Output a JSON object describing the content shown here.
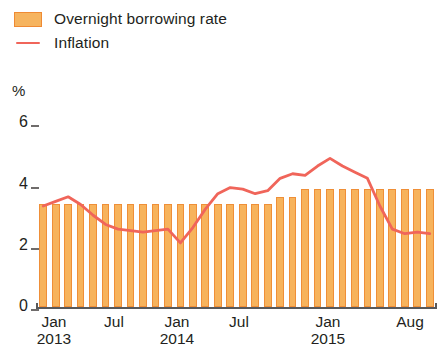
{
  "legend": {
    "items": [
      {
        "label": "Overnight borrowing rate",
        "type": "bar",
        "color": "#f7b35c",
        "border": "#ef8f38",
        "icon": "bar-swatch-icon"
      },
      {
        "label": "Inflation",
        "type": "line",
        "color": "#f0655a",
        "icon": "line-swatch-icon"
      }
    ]
  },
  "axes": {
    "y_unit_label": "%",
    "y_ticks": [
      "6",
      "4",
      "2",
      "0"
    ],
    "x_ticks": [
      {
        "month": "Jan",
        "year": "2013"
      },
      {
        "month": "Jul",
        "year": ""
      },
      {
        "month": "Jan",
        "year": "2014"
      },
      {
        "month": "Jul",
        "year": ""
      },
      {
        "month": "Jan",
        "year": "2015"
      },
      {
        "month": "Aug",
        "year": ""
      }
    ]
  },
  "chart_data": {
    "type": "bar",
    "title": "",
    "subtitle": "",
    "xlabel": "",
    "ylabel": "%",
    "ylim": [
      0,
      6
    ],
    "yticks": [
      0,
      2,
      4,
      6
    ],
    "grid": false,
    "legend_position": "top-left",
    "categories": [
      "Jan 2013",
      "Feb 2013",
      "Mar 2013",
      "Apr 2013",
      "May 2013",
      "Jun 2013",
      "Jul 2013",
      "Aug 2013",
      "Sep 2013",
      "Oct 2013",
      "Nov 2013",
      "Dec 2013",
      "Jan 2014",
      "Feb 2014",
      "Mar 2014",
      "Apr 2014",
      "May 2014",
      "Jun 2014",
      "Jul 2014",
      "Aug 2014",
      "Sep 2014",
      "Oct 2014",
      "Nov 2014",
      "Dec 2014",
      "Jan 2015",
      "Feb 2015",
      "Mar 2015",
      "Apr 2015",
      "May 2015",
      "Jun 2015",
      "Jul 2015",
      "Aug 2015"
    ],
    "series": [
      {
        "name": "Overnight borrowing rate",
        "type": "bar",
        "color": "#f7b35c",
        "values": [
          3.35,
          3.35,
          3.35,
          3.35,
          3.35,
          3.35,
          3.35,
          3.35,
          3.35,
          3.35,
          3.35,
          3.35,
          3.35,
          3.35,
          3.35,
          3.35,
          3.35,
          3.35,
          3.35,
          3.6,
          3.6,
          3.85,
          3.85,
          3.85,
          3.85,
          3.85,
          3.85,
          3.85,
          3.85,
          3.85,
          3.85,
          3.85
        ]
      },
      {
        "name": "Inflation",
        "type": "line",
        "color": "#f0655a",
        "values": [
          3.3,
          3.45,
          3.6,
          3.35,
          3.0,
          2.7,
          2.55,
          2.5,
          2.45,
          2.5,
          2.55,
          2.1,
          2.6,
          3.2,
          3.7,
          3.9,
          3.85,
          3.7,
          3.8,
          4.2,
          4.35,
          4.3,
          4.6,
          4.85,
          4.6,
          4.4,
          4.2,
          3.3,
          2.55,
          2.4,
          2.45,
          2.4
        ]
      }
    ]
  },
  "line_path_values": [
    3.3,
    3.45,
    3.6,
    3.35,
    3.0,
    2.7,
    2.55,
    2.5,
    2.45,
    2.5,
    2.55,
    2.1,
    2.6,
    3.2,
    3.7,
    3.9,
    3.85,
    3.7,
    3.8,
    4.2,
    4.35,
    4.3,
    4.6,
    4.85,
    4.6,
    4.4,
    4.2,
    3.3,
    2.55,
    2.4,
    2.45,
    2.4
  ]
}
